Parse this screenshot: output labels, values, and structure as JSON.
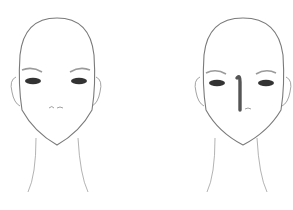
{
  "figure": {
    "faces": [
      {
        "id": "left",
        "label": "face-plain"
      },
      {
        "id": "right",
        "label": "face-with-nose-contour"
      }
    ],
    "colors": {
      "outline": "#7a7a7a",
      "eye": "#333333",
      "brow": "#9a9a9a",
      "contour": "#555555",
      "skin": "#ffffff"
    }
  }
}
